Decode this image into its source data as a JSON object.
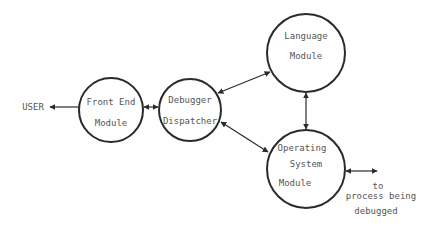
{
  "diagram": {
    "colors": {
      "stroke": "#2a2a2a",
      "text": "#555555",
      "background": "#ffffff"
    },
    "external_labels": {
      "user": "USER",
      "process": [
        "to",
        "process being",
        "debugged"
      ]
    },
    "nodes": [
      {
        "id": "front-end",
        "lines": [
          "Front End",
          "Module"
        ]
      },
      {
        "id": "dispatcher",
        "lines": [
          "Debugger",
          "Dispatcher"
        ]
      },
      {
        "id": "language",
        "lines": [
          "Language",
          "Module"
        ]
      },
      {
        "id": "os",
        "lines": [
          "Operating",
          "System",
          "Module"
        ]
      }
    ],
    "edges": [
      {
        "from": "front-end",
        "to": "USER",
        "direction": "to-user"
      },
      {
        "from": "front-end",
        "to": "dispatcher",
        "direction": "bidirectional"
      },
      {
        "from": "dispatcher",
        "to": "language",
        "direction": "bidirectional"
      },
      {
        "from": "dispatcher",
        "to": "os",
        "direction": "bidirectional"
      },
      {
        "from": "language",
        "to": "os",
        "direction": "bidirectional"
      },
      {
        "from": "os",
        "to": "process being debugged",
        "direction": "bidirectional"
      }
    ]
  }
}
